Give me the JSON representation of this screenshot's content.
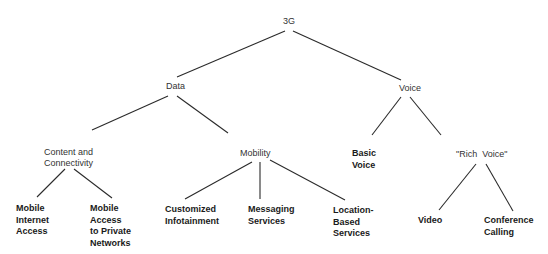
{
  "diagram": {
    "type": "tree",
    "root": "3G",
    "nodes": {
      "root": {
        "label": "3G"
      },
      "data": {
        "label": "Data"
      },
      "voice": {
        "label": "Voice"
      },
      "content": {
        "lines": [
          "Content and",
          "Connectivity"
        ]
      },
      "mobility": {
        "label": "Mobility"
      },
      "basic_voice": {
        "lines": [
          "Basic",
          "Voice"
        ]
      },
      "rich_voice": {
        "label": "\"Rich  Voice\""
      },
      "mobile_internet": {
        "lines": [
          "Mobile",
          "Internet",
          "Access"
        ]
      },
      "mobile_access": {
        "lines": [
          "Mobile",
          "Access",
          "to Private",
          "Networks"
        ]
      },
      "infotainment": {
        "lines": [
          "Customized",
          "Infotainment"
        ]
      },
      "messaging": {
        "lines": [
          "Messaging",
          "Services"
        ]
      },
      "location": {
        "lines": [
          "Location-",
          "Based",
          "Services"
        ]
      },
      "video": {
        "label": "Video"
      },
      "conference": {
        "lines": [
          "Conference",
          "Calling"
        ]
      }
    },
    "edges": [
      [
        "3G",
        "Data"
      ],
      [
        "3G",
        "Voice"
      ],
      [
        "Data",
        "Content and Connectivity"
      ],
      [
        "Data",
        "Mobility"
      ],
      [
        "Voice",
        "Basic Voice"
      ],
      [
        "Voice",
        "\"Rich Voice\""
      ],
      [
        "Content and Connectivity",
        "Mobile Internet Access"
      ],
      [
        "Content and Connectivity",
        "Mobile Access to Private Networks"
      ],
      [
        "Mobility",
        "Customized Infotainment"
      ],
      [
        "Mobility",
        "Messaging Services"
      ],
      [
        "Mobility",
        "Location-Based Services"
      ],
      [
        "\"Rich Voice\"",
        "Video"
      ],
      [
        "\"Rich Voice\"",
        "Conference Calling"
      ]
    ]
  }
}
